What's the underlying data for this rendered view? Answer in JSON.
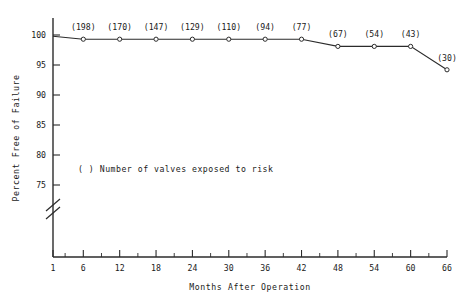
{
  "chart_data": {
    "type": "line",
    "title": "",
    "xlabel": "Months After Operation",
    "ylabel": "Percent Free of Failure",
    "xlim": [
      1,
      66
    ],
    "ylim": [
      75,
      100
    ],
    "grid": false,
    "legend": null,
    "annotation": "(  ) Number of valves exposed to risk",
    "y_axis_break": true,
    "x_tick_labels": [
      "1",
      "6",
      "12",
      "18",
      "24",
      "30",
      "36",
      "42",
      "48",
      "54",
      "60",
      "66"
    ],
    "x_ticks": [
      1,
      6,
      12,
      18,
      24,
      30,
      36,
      42,
      48,
      54,
      60,
      66
    ],
    "x_minor_ticks": [
      3,
      9,
      15,
      21,
      27,
      33,
      39,
      45,
      51,
      57,
      63
    ],
    "y_tick_labels": [
      "100",
      "95",
      "90",
      "85",
      "80",
      "75"
    ],
    "y_ticks": [
      100,
      95,
      90,
      85,
      80,
      75
    ],
    "x": [
      1,
      6,
      12,
      18,
      24,
      30,
      36,
      42,
      48,
      54,
      60,
      66
    ],
    "values": [
      99.8,
      99.3,
      99.3,
      99.3,
      99.3,
      99.3,
      99.3,
      99.3,
      98.1,
      98.1,
      98.1,
      94.2
    ],
    "point_labels": [
      "",
      "(198)",
      "(170)",
      "(147)",
      "(129)",
      "(110)",
      "(94)",
      "(77)",
      "(67)",
      "(54)",
      "(43)",
      "(30)"
    ],
    "n_at_risk": [
      null,
      198,
      170,
      147,
      129,
      110,
      94,
      77,
      67,
      54,
      43,
      30
    ],
    "marker": "open-circle",
    "line_color": "#2b2b2b"
  }
}
